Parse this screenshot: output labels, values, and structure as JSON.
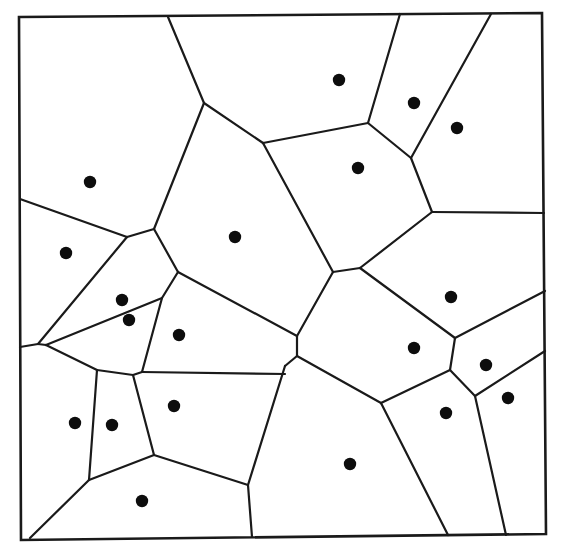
{
  "diagram": {
    "type": "voronoi",
    "title": "",
    "colors": {
      "line": "#1a1a1a",
      "site": "#0d0d0d",
      "background": "#ffffff"
    },
    "frame": [
      [
        19,
        17
      ],
      [
        542,
        13
      ],
      [
        546,
        534
      ],
      [
        21,
        540
      ]
    ],
    "edges": [
      [
        [
          168,
          17
        ],
        [
          204,
          103
        ]
      ],
      [
        [
          204,
          103
        ],
        [
          263,
          143
        ]
      ],
      [
        [
          204,
          103
        ],
        [
          154,
          229
        ]
      ],
      [
        [
          263,
          143
        ],
        [
          368,
          123
        ]
      ],
      [
        [
          368,
          123
        ],
        [
          400,
          14
        ]
      ],
      [
        [
          368,
          123
        ],
        [
          411,
          158
        ]
      ],
      [
        [
          411,
          158
        ],
        [
          491,
          14
        ]
      ],
      [
        [
          411,
          158
        ],
        [
          432,
          212
        ]
      ],
      [
        [
          432,
          212
        ],
        [
          544,
          213
        ]
      ],
      [
        [
          432,
          212
        ],
        [
          360,
          268
        ]
      ],
      [
        [
          263,
          143
        ],
        [
          333,
          272
        ]
      ],
      [
        [
          333,
          272
        ],
        [
          360,
          268
        ]
      ],
      [
        [
          333,
          272
        ],
        [
          297,
          336
        ]
      ],
      [
        [
          297,
          336
        ],
        [
          297,
          356
        ]
      ],
      [
        [
          297,
          356
        ],
        [
          285,
          366
        ]
      ],
      [
        [
          297,
          356
        ],
        [
          381,
          403
        ]
      ],
      [
        [
          178,
          272
        ],
        [
          297,
          336
        ]
      ],
      [
        [
          154,
          229
        ],
        [
          178,
          272
        ]
      ],
      [
        [
          154,
          229
        ],
        [
          127,
          237
        ]
      ],
      [
        [
          127,
          237
        ],
        [
          20,
          199
        ]
      ],
      [
        [
          127,
          237
        ],
        [
          38,
          344
        ]
      ],
      [
        [
          178,
          272
        ],
        [
          162,
          298
        ]
      ],
      [
        [
          162,
          298
        ],
        [
          46,
          345
        ]
      ],
      [
        [
          162,
          298
        ],
        [
          142,
          372
        ]
      ],
      [
        [
          20,
          347
        ],
        [
          38,
          344
        ]
      ],
      [
        [
          38,
          344
        ],
        [
          46,
          345
        ]
      ],
      [
        [
          46,
          345
        ],
        [
          97,
          370
        ]
      ],
      [
        [
          97,
          370
        ],
        [
          133,
          375
        ]
      ],
      [
        [
          133,
          375
        ],
        [
          142,
          372
        ]
      ],
      [
        [
          142,
          372
        ],
        [
          285,
          374
        ]
      ],
      [
        [
          360,
          268
        ],
        [
          455,
          338
        ]
      ],
      [
        [
          455,
          338
        ],
        [
          545,
          291
        ]
      ],
      [
        [
          455,
          338
        ],
        [
          450,
          370
        ]
      ],
      [
        [
          450,
          370
        ],
        [
          381,
          403
        ]
      ],
      [
        [
          450,
          370
        ],
        [
          475,
          396
        ]
      ],
      [
        [
          475,
          396
        ],
        [
          545,
          351
        ]
      ],
      [
        [
          475,
          396
        ],
        [
          506,
          535
        ]
      ],
      [
        [
          381,
          403
        ],
        [
          448,
          535
        ]
      ],
      [
        [
          285,
          366
        ],
        [
          248,
          485
        ]
      ],
      [
        [
          248,
          485
        ],
        [
          252,
          537
        ]
      ],
      [
        [
          248,
          485
        ],
        [
          154,
          455
        ]
      ],
      [
        [
          154,
          455
        ],
        [
          133,
          375
        ]
      ],
      [
        [
          154,
          455
        ],
        [
          89,
          480
        ]
      ],
      [
        [
          89,
          480
        ],
        [
          97,
          370
        ]
      ],
      [
        [
          89,
          480
        ],
        [
          30,
          538
        ]
      ]
    ],
    "sites": [
      [
        339,
        80
      ],
      [
        414,
        103
      ],
      [
        457,
        128
      ],
      [
        358,
        168
      ],
      [
        90,
        182
      ],
      [
        235,
        237
      ],
      [
        66,
        253
      ],
      [
        122,
        300
      ],
      [
        129,
        320
      ],
      [
        179,
        335
      ],
      [
        451,
        297
      ],
      [
        414,
        348
      ],
      [
        486,
        365
      ],
      [
        508,
        398
      ],
      [
        446,
        413
      ],
      [
        75,
        423
      ],
      [
        112,
        425
      ],
      [
        174,
        406
      ],
      [
        350,
        464
      ],
      [
        142,
        501
      ]
    ]
  }
}
